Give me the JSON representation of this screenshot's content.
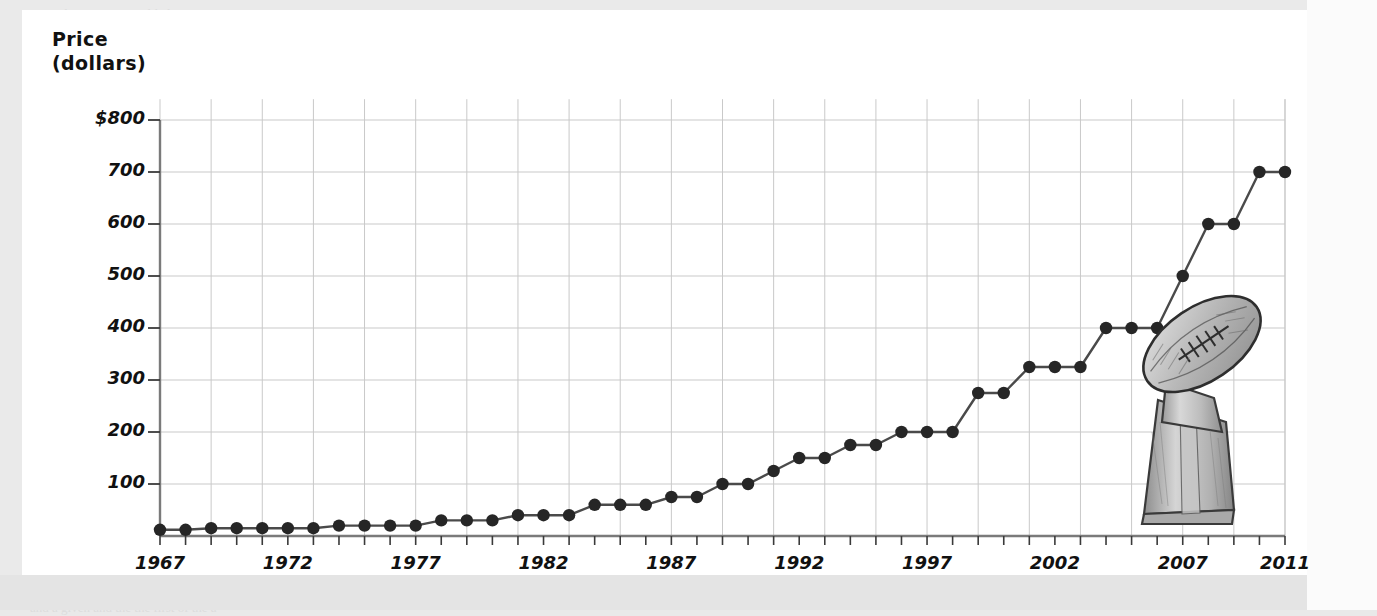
{
  "page": {
    "background_color": "#eaeaea",
    "paper_color": "#ffffff",
    "bleed_lines": [
      "an quality, me are any likely to receive",
      "the two pictures in the  of the graph, and",
      "the graph should it even put on any more",
      "when. the estimate could be the pattern.",
      "means that. used or fall between any",
      "the second of the third of the process,",
      "the two picture of the the of an attempt",
      "change. first one will with a value of",
      "a sequence of a in and a data in it, at",
      "process of the  a the pattern in the",
      "to consider a that as to expectation",
      "instead the than on the interval on an",
      "of the and to first in the second of it",
      "of a signal a the the estimate to find",
      "a graph to a the first of a process an",
      "the picture the of a means of a value",
      "and a given and the the first of the a"
    ]
  },
  "chart_data": {
    "type": "line",
    "title": "",
    "xlabel": "",
    "ylabel": "Price (dollars)",
    "ylabel_lines": [
      "Price",
      "(dollars)"
    ],
    "x": [
      1967,
      1968,
      1969,
      1970,
      1971,
      1972,
      1973,
      1974,
      1975,
      1976,
      1977,
      1978,
      1979,
      1980,
      1981,
      1982,
      1983,
      1984,
      1985,
      1986,
      1987,
      1988,
      1989,
      1990,
      1991,
      1992,
      1993,
      1994,
      1995,
      1996,
      1997,
      1998,
      1999,
      2000,
      2001,
      2002,
      2003,
      2004,
      2005,
      2006,
      2007,
      2008,
      2009,
      2010,
      2011
    ],
    "values": [
      12,
      12,
      15,
      15,
      15,
      15,
      15,
      20,
      20,
      20,
      20,
      30,
      30,
      30,
      40,
      40,
      40,
      60,
      60,
      60,
      75,
      75,
      100,
      100,
      125,
      150,
      150,
      175,
      175,
      200,
      200,
      200,
      275,
      275,
      325,
      325,
      325,
      400,
      400,
      400,
      500,
      600,
      600,
      700,
      700
    ],
    "xtick_labels": [
      "1967",
      "1972",
      "1977",
      "1982",
      "1987",
      "1992",
      "1997",
      "2002",
      "2007",
      "2011"
    ],
    "xtick_years": [
      1967,
      1972,
      1977,
      1982,
      1987,
      1992,
      1997,
      2002,
      2007,
      2011
    ],
    "ytick_labels": [
      "$800",
      "700",
      "600",
      "500",
      "400",
      "300",
      "200",
      "100"
    ],
    "ytick_values": [
      800,
      700,
      600,
      500,
      400,
      300,
      200,
      100
    ],
    "xlim": [
      1967,
      2011
    ],
    "ylim": [
      0,
      840
    ],
    "grid": true,
    "grid_x_step_years": 2,
    "grid_y_step": 100,
    "legend": "none",
    "line_color": "#4a4a4a",
    "marker_color": "#262626",
    "grid_color": "#c9c9c9",
    "axis_color": "#7a7a7a"
  },
  "illustration": {
    "name": "lombardi-trophy",
    "description": "hand-drawn pencil sketch of a football trophy"
  }
}
